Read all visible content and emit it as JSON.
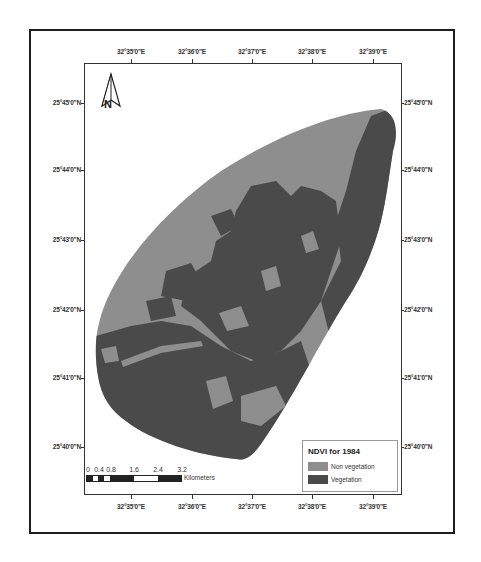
{
  "map": {
    "legend": {
      "title": "NDVI for 1984",
      "items": [
        {
          "label": "Non vegetation",
          "color": "#8e8e8e"
        },
        {
          "label": "Vegetation",
          "color": "#4a4a4a"
        }
      ]
    },
    "longitude_labels": [
      "32°35'0\"E",
      "32°36'0\"E",
      "32°37'0\"E",
      "32°38'0\"E",
      "32°39'0\"E"
    ],
    "latitude_labels": [
      "25°45'0\"N",
      "25°44'0\"N",
      "25°43'0\"N",
      "25°42'0\"N",
      "25°41'0\"N",
      "25°40'0\"N"
    ],
    "north_arrow": {
      "label": "N",
      "icon": "north-arrow-icon"
    },
    "scale_bar": {
      "ticks": [
        "0",
        "0.4",
        "0.8",
        "1.6",
        "2.4",
        "3.2"
      ],
      "unit": "Kilometers"
    },
    "colors": {
      "non_vegetation": "#8e8e8e",
      "vegetation": "#4a4a4a",
      "frame": "#1e1e1e",
      "background": "#ffffff"
    }
  }
}
